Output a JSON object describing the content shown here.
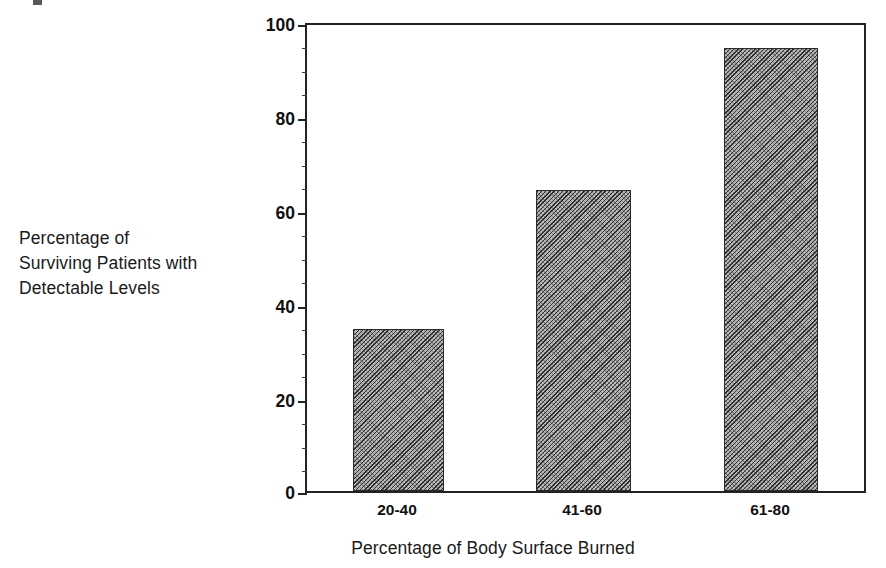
{
  "chart_data": {
    "type": "bar",
    "title": "",
    "subtitle": "",
    "categories": [
      "20-40",
      "41-60",
      "61-80"
    ],
    "values": [
      34.7,
      64.5,
      95.0
    ],
    "series": [
      {
        "name": "Percentage of Surviving Patients with Detectable Levels",
        "values": [
          34.7,
          64.5,
          95.0
        ]
      }
    ],
    "xlabel": "Percentage of Body Surface Burned",
    "ylabel": "Percentage of Surviving Patients with Detectable Levels",
    "ylabel_lines": [
      "Percentage of",
      "Surviving Patients with",
      "Detectable Levels"
    ],
    "ylim": [
      0,
      100
    ],
    "ytick_labels": [
      "0",
      "20",
      "40",
      "60",
      "80",
      "100"
    ],
    "ytick_values": [
      0,
      20,
      40,
      60,
      80,
      100
    ],
    "yminor_step": 5,
    "grid": false,
    "legend": false,
    "legend_position": "none",
    "bar_fill": "#b9b9b9",
    "bar_pattern": "diagonal-hatch",
    "bar_edge_color": "#2b2b2b",
    "axis_color": "#222222",
    "background": "#ffffff"
  },
  "axis": {
    "y": {
      "name": "y-axis",
      "ticks": [
        {
          "label": "100",
          "value": 100
        },
        {
          "label": "80",
          "value": 80
        },
        {
          "label": "60",
          "value": 60
        },
        {
          "label": "40",
          "value": 40
        },
        {
          "label": "20",
          "value": 20
        },
        {
          "label": "0",
          "value": 0
        }
      ]
    },
    "x": {
      "name": "x-axis",
      "title": "Percentage of Body Surface Burned",
      "ticks": [
        {
          "label": "20-40"
        },
        {
          "label": "41-60"
        },
        {
          "label": "61-80"
        }
      ]
    }
  }
}
